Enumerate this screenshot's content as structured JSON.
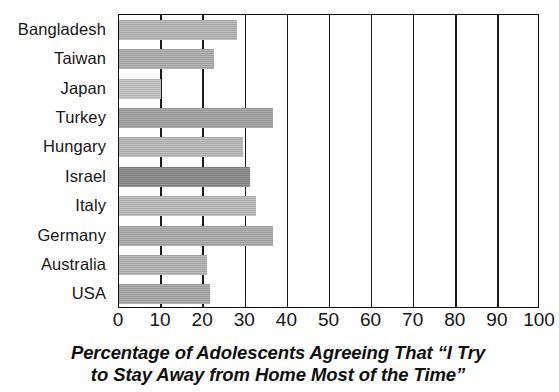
{
  "chart_data": {
    "type": "bar",
    "orientation": "horizontal",
    "title_lines": [
      "Percentage of Adolescents Agreeing That “I Try",
      "to Stay Away from Home Most of the Time”"
    ],
    "xlabel": "",
    "ylabel": "",
    "xlim": [
      0,
      100
    ],
    "xticks": [
      0,
      10,
      20,
      30,
      40,
      50,
      60,
      70,
      80,
      90,
      100
    ],
    "xtick_labels": [
      "0",
      "10",
      "20",
      "30",
      "40",
      "50",
      "60",
      "70",
      "80",
      "90",
      "100"
    ],
    "grid": "vertical",
    "legend": "none",
    "categories": [
      "Bangladesh",
      "Taiwan",
      "Japan",
      "Turkey",
      "Hungary",
      "Israel",
      "Italy",
      "Germany",
      "Australia",
      "USA"
    ],
    "values": [
      28,
      22.5,
      10,
      36.5,
      29.5,
      31,
      32.5,
      36.5,
      21,
      21.5
    ],
    "bars": [
      {
        "category": "Bangladesh",
        "value": 28,
        "color": "#b0b0b0"
      },
      {
        "category": "Taiwan",
        "value": 22.5,
        "color": "#a6a6a6"
      },
      {
        "category": "Japan",
        "value": 10,
        "color": "#bdbdbd"
      },
      {
        "category": "Turkey",
        "value": 36.5,
        "color": "#9a9a9a"
      },
      {
        "category": "Hungary",
        "value": 29.5,
        "color": "#b2b2b2"
      },
      {
        "category": "Israel",
        "value": 31,
        "color": "#818181"
      },
      {
        "category": "Italy",
        "value": 32.5,
        "color": "#b4b4b4"
      },
      {
        "category": "Germany",
        "value": 36.5,
        "color": "#a3a3a3"
      },
      {
        "category": "Australia",
        "value": 21,
        "color": "#adadad"
      },
      {
        "category": "USA",
        "value": 21.5,
        "color": "#9f9f9f"
      }
    ]
  }
}
